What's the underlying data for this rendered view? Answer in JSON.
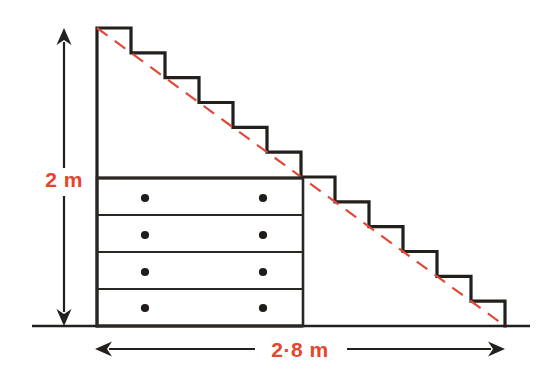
{
  "figure": {
    "background_color": "#ffffff",
    "width": 550,
    "height": 388
  },
  "colors": {
    "ink": "#231f1c",
    "outline": "#231f1c",
    "dimension_text": "#e8442a",
    "diagonal_dashed": "#e0493a",
    "ground_line": "#231f1c",
    "drawer_divider": "#2b2724",
    "handle_dot": "#201c1a"
  },
  "dimensions": {
    "height_label": {
      "text": "2 m",
      "value": 2,
      "unit": "m",
      "orientation": "vertical",
      "arrow": {
        "x": 64,
        "y_top": 28,
        "y_bottom": 326,
        "double_headed": true
      }
    },
    "width_label": {
      "text": "2·8 m",
      "value": 2.8,
      "unit": "m",
      "orientation": "horizontal",
      "arrow": {
        "y": 349,
        "x_left": 95,
        "x_right": 505,
        "double_headed": true
      }
    }
  },
  "staircase": {
    "step_count": 12,
    "top_left": {
      "x": 97,
      "y": 28
    },
    "bottom_right": {
      "x": 505,
      "y": 326
    },
    "step_width": 34,
    "step_height": 24.83,
    "stroke_width": 3.2
  },
  "ground": {
    "y": 326,
    "x_start": 32,
    "x_end": 530,
    "stroke_width": 2.4
  },
  "diagonal": {
    "description": "red dashed line from top of staircase to foot",
    "x1": 97,
    "y1": 28,
    "x2": 505,
    "y2": 326,
    "dash": "13 9",
    "stroke_width": 2.2
  },
  "drawers": {
    "left": 97,
    "right": 303,
    "top": 178,
    "bottom": 326,
    "count": 4,
    "divider_ys": [
      178,
      215,
      252,
      289,
      326
    ],
    "handles_per_drawer": 2,
    "handle_x_positions": [
      145,
      263
    ],
    "handle_radius": 4.1,
    "rows": [
      {
        "name": "drawer-1",
        "handle_y": 198
      },
      {
        "name": "drawer-2",
        "handle_y": 235
      },
      {
        "name": "drawer-3",
        "handle_y": 272
      },
      {
        "name": "drawer-4",
        "handle_y": 308
      }
    ]
  }
}
